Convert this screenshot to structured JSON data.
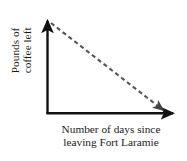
{
  "figure": {
    "background_color": "#ffffff",
    "axis_color": "#111111",
    "trend_color": "#555555",
    "cropped_text_above": "· · ·"
  },
  "axes": {
    "y_label_line1": "Pounds of",
    "y_label_line2": "coffee left",
    "x_label_line1": "Number of days since",
    "x_label_line2": "leaving Fort Laramie"
  },
  "chart_data": {
    "type": "line",
    "title": "",
    "subtitle": "",
    "xlabel": "Number of days since leaving Fort Laramie",
    "ylabel": "Pounds of coffee left",
    "grid": false,
    "legend": "none",
    "axis_arrows": true,
    "tick_labels_shown": false,
    "xlim": [
      0,
      10
    ],
    "ylim": [
      0,
      10
    ],
    "xticks": [],
    "yticks": [],
    "series": [
      {
        "name": "Pounds of coffee left",
        "style": "dashed",
        "color": "#555555",
        "arrow_end": true,
        "x": [
          0,
          10
        ],
        "values": [
          10,
          0
        ],
        "description": "Linear decrease from full supply at departure to zero coffee remaining"
      }
    ],
    "annotations": []
  }
}
